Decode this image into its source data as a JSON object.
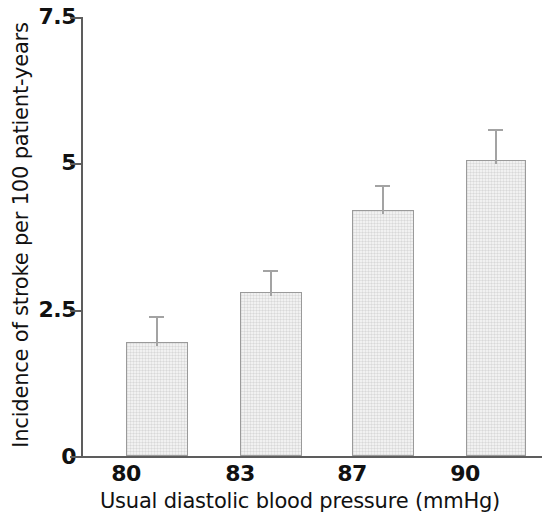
{
  "chart_data": {
    "type": "bar",
    "title": "",
    "xlabel": "Usual diastolic blood pressure (mmHg)",
    "ylabel": "Incidence of stroke per 100 patient-years",
    "categories": [
      "80",
      "83",
      "87",
      "90"
    ],
    "values": [
      1.95,
      2.8,
      4.2,
      5.05
    ],
    "error_upper": [
      2.35,
      3.15,
      4.6,
      5.55
    ],
    "errors": [
      0.4,
      0.35,
      0.4,
      0.5
    ],
    "ylim": [
      0,
      7.5
    ],
    "ytick_labels": [
      "0",
      "2.5",
      "5",
      "7.5"
    ],
    "ytick_values": [
      0,
      2.5,
      5,
      7.5
    ],
    "xtick_labels": [
      "80",
      "83",
      "87",
      "90"
    ],
    "grid": false,
    "legend": null,
    "bar_fill_color": "#f1f1f1",
    "bar_edge_color": "#9a9a9a",
    "axis_color": "#5d5d5d",
    "error_bar_color": "#a3a3a3",
    "background_color": "#ffffff"
  }
}
